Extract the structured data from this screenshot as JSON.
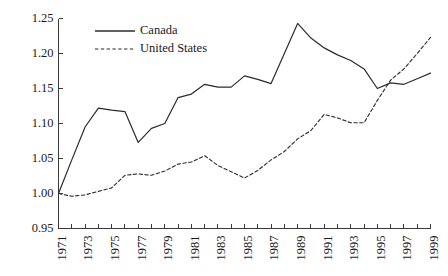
{
  "chart_data": {
    "type": "line",
    "title": "",
    "subtitle": "",
    "xlabel": "",
    "ylabel": "",
    "grid": false,
    "legend_position": "top-left-inside",
    "x": [
      1971,
      1972,
      1973,
      1974,
      1975,
      1976,
      1977,
      1978,
      1979,
      1980,
      1981,
      1982,
      1983,
      1984,
      1985,
      1986,
      1987,
      1988,
      1989,
      1990,
      1991,
      1992,
      1993,
      1994,
      1995,
      1996,
      1997,
      1998,
      1999
    ],
    "xlim": [
      1971,
      1999
    ],
    "ylim": [
      0.95,
      1.25
    ],
    "ytick_values": [
      0.95,
      1.0,
      1.05,
      1.1,
      1.15,
      1.2,
      1.25
    ],
    "ytick_labels": [
      "0.95",
      "1.00",
      "1.05",
      "1.10",
      "1.15",
      "1.20",
      "1.25"
    ],
    "xtick_values": [
      1971,
      1973,
      1975,
      1977,
      1979,
      1981,
      1983,
      1985,
      1987,
      1989,
      1991,
      1993,
      1995,
      1997,
      1999
    ],
    "xtick_labels": [
      "1971",
      "1973",
      "1975",
      "1977",
      "1979",
      "1981",
      "1983",
      "1985",
      "1987",
      "1989",
      "1991",
      "1993",
      "1995",
      "1997",
      "1999"
    ],
    "xtick_minor_values": [
      1972,
      1974,
      1976,
      1978,
      1980,
      1982,
      1984,
      1986,
      1988,
      1990,
      1992,
      1994,
      1996,
      1998
    ],
    "series": [
      {
        "name": "Canada",
        "style": "solid",
        "color": "#2b2b2b",
        "values": [
          1.0,
          1.048,
          1.095,
          1.122,
          1.119,
          1.117,
          1.073,
          1.093,
          1.1,
          1.137,
          1.142,
          1.156,
          1.152,
          1.152,
          1.168,
          1.163,
          1.157,
          1.2,
          1.243,
          1.222,
          1.208,
          1.198,
          1.19,
          1.178,
          1.15,
          1.158,
          1.156,
          1.164,
          1.172
        ]
      },
      {
        "name": "United States",
        "style": "dashed",
        "color": "#2b2b2b",
        "values": [
          1.0,
          0.996,
          0.998,
          1.003,
          1.008,
          1.026,
          1.028,
          1.026,
          1.032,
          1.042,
          1.045,
          1.054,
          1.04,
          1.031,
          1.022,
          1.033,
          1.048,
          1.06,
          1.078,
          1.09,
          1.113,
          1.108,
          1.101,
          1.101,
          1.133,
          1.162,
          1.178,
          1.2,
          1.223
        ]
      }
    ]
  },
  "legend": {
    "items": [
      {
        "label": "Canada",
        "style": "solid"
      },
      {
        "label": "United States",
        "style": "dashed"
      }
    ]
  }
}
